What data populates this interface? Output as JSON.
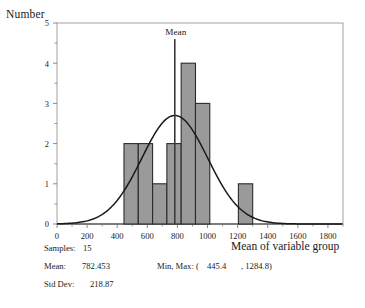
{
  "axes": {
    "ylabel": "Number",
    "xlabel": "Mean of variable group",
    "mean_marker_label": "Mean"
  },
  "stats": {
    "samples_label": "Samples:",
    "samples_value": "15",
    "mean_label": "Mean:",
    "mean_value": "782.453",
    "minmax_label": "Min, Max:  (",
    "min_value": "445.4",
    "max_value": ", 1284.8)",
    "sd_label": "Std Dev:",
    "sd_value": "218.87"
  },
  "colors": {
    "bar_fill": "#9a9a9a",
    "bar_stroke": "#2b2b2b",
    "curve": "#1a1a1a",
    "axis": "#6e6e6e",
    "frame": "#8a8a8a",
    "mean_line": "#3a3a3a"
  },
  "chart_data": {
    "type": "bar",
    "title": "",
    "xlabel": "Mean of variable group",
    "ylabel": "Number",
    "xlim": [
      0,
      1900
    ],
    "ylim": [
      0,
      5
    ],
    "xticks": [
      0,
      200,
      400,
      600,
      800,
      1000,
      1200,
      1400,
      1600,
      1800
    ],
    "xtick_labels": [
      "0",
      "200",
      "400",
      "600",
      "800",
      "1000",
      "1200",
      "1400",
      "1600",
      "1800"
    ],
    "yticks": [
      0,
      1,
      2,
      3,
      4,
      5
    ],
    "ytick_labels": [
      "0",
      "1",
      "2",
      "3",
      "4",
      "5"
    ],
    "minor_ticks": true,
    "grid": false,
    "legend": false,
    "bin_edges": [
      445,
      540,
      635,
      730,
      825,
      920,
      1015,
      1110,
      1205,
      1300
    ],
    "bin_counts": [
      2,
      2,
      1,
      2,
      4,
      3,
      0,
      0,
      1
    ],
    "bin_width": 95,
    "overlay_curve": {
      "kind": "normal",
      "mean": 782.453,
      "std_dev": 218.87,
      "peak_value": 2.7,
      "scale_n": 15
    },
    "mean_line": {
      "x": 782.453,
      "label": "Mean",
      "y_top": 4.6
    },
    "annotations": [
      "Samples: 15",
      "Mean: 782.453",
      "Min, Max: ( 445.4 , 1284.8)",
      "Std Dev: 218.87"
    ]
  }
}
